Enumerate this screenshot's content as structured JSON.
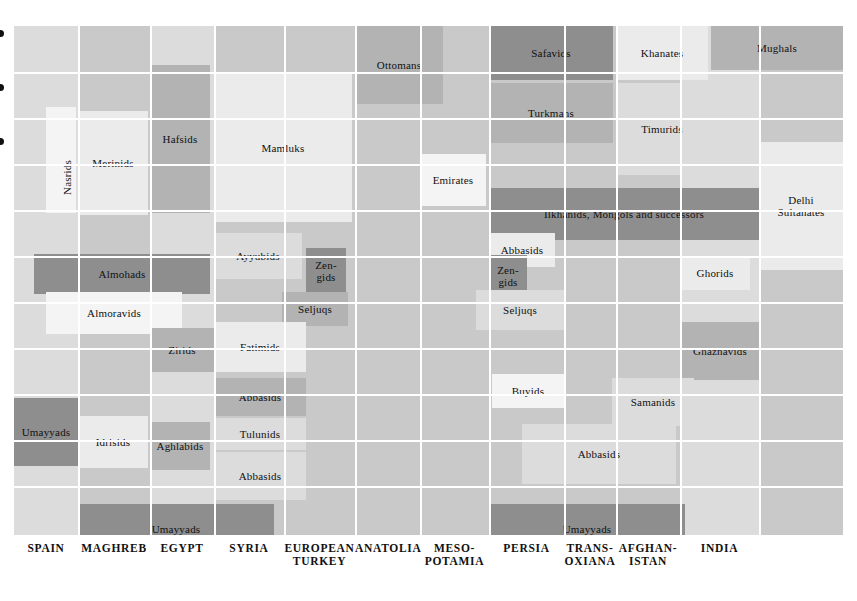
{
  "chart_data": {
    "type": "table",
    "xlabel": "Region",
    "ylabel": "Time",
    "grid": true,
    "legend": "none",
    "colors": {
      "dark": "#8e8e8e",
      "mid": "#b3b3b3",
      "base": "#c9c9c9",
      "light": "#dcdcdc",
      "pale": "#ebebeb",
      "white": "#f4f4f4",
      "gridline": "#ffffff",
      "text": "#111111"
    },
    "columns": [
      {
        "key": "spain",
        "label": "SPAIN"
      },
      {
        "key": "maghreb",
        "label": "MAGHREB"
      },
      {
        "key": "egypt",
        "label": "EGYPT"
      },
      {
        "key": "syria",
        "label": "SYRIA"
      },
      {
        "key": "euroturkey",
        "label": "EUROPEAN\nTURKEY"
      },
      {
        "key": "anatolia",
        "label": "ANATOLIA"
      },
      {
        "key": "mesopotamia",
        "label": "MESO-\nPOTAMIA"
      },
      {
        "key": "persia",
        "label": "PERSIA"
      },
      {
        "key": "transoxiana",
        "label": "TRANS-\nOXIANA"
      },
      {
        "key": "afghanistan",
        "label": "AFGHAN-\nISTAN"
      },
      {
        "key": "india",
        "label": "INDIA"
      }
    ],
    "entries": [
      {
        "name": "Ottomans",
        "label": "Ottomans",
        "x": 341,
        "y": 0,
        "w": 88,
        "h": 78,
        "tone": "mid"
      },
      {
        "name": "Safavids",
        "label": "Safavids",
        "x": 475,
        "y": 0,
        "w": 124,
        "h": 54,
        "tone": "dark"
      },
      {
        "name": "Khanates",
        "label": "Khanates",
        "x": 602,
        "y": 0,
        "w": 92,
        "h": 54,
        "tone": "pale"
      },
      {
        "name": "Mughals",
        "label": "Mughals",
        "x": 697,
        "y": 0,
        "w": 132,
        "h": 44,
        "tone": "mid"
      },
      {
        "name": "Turkmans",
        "label": "Turkmans",
        "x": 475,
        "y": 57,
        "w": 124,
        "h": 60,
        "tone": "mid"
      },
      {
        "name": "Timurids",
        "label": "Timurids",
        "x": 602,
        "y": 57,
        "w": 92,
        "h": 92,
        "tone": "light"
      },
      {
        "name": "Hafsids",
        "label": "Hafsids",
        "x": 136,
        "y": 39,
        "w": 60,
        "h": 148,
        "tone": "mid"
      },
      {
        "name": "Nasrids",
        "label": "Nasrids",
        "x": 32,
        "y": 81,
        "w": 30,
        "h": 106,
        "tone": "white",
        "vertical": true
      },
      {
        "name": "Merinids",
        "label": "Merinids",
        "x": 64,
        "y": 85,
        "w": 70,
        "h": 104,
        "tone": "pale"
      },
      {
        "name": "Mamluks",
        "label": "Mamluks",
        "x": 200,
        "y": 48,
        "w": 138,
        "h": 148,
        "tone": "pale"
      },
      {
        "name": "Emirates",
        "label": "Emirates",
        "x": 406,
        "y": 128,
        "w": 66,
        "h": 52,
        "tone": "white"
      },
      {
        "name": "DelhiSult",
        "label": "Delhi\nSultanates",
        "x": 745,
        "y": 116,
        "w": 84,
        "h": 128,
        "tone": "pale"
      },
      {
        "name": "Ilkhanids",
        "label": "Ilkhanids, Mongols and successors",
        "x": 475,
        "y": 162,
        "w": 270,
        "h": 52,
        "tone": "dark"
      },
      {
        "name": "AbbasidsMeso1",
        "label": "Abbasids",
        "x": 475,
        "y": 207,
        "w": 66,
        "h": 34,
        "tone": "pale"
      },
      {
        "name": "Ayyubids",
        "label": "Ayyubids",
        "x": 200,
        "y": 207,
        "w": 88,
        "h": 46,
        "tone": "light"
      },
      {
        "name": "ZengidsSyria",
        "label": "Zen-\ngids",
        "x": 292,
        "y": 222,
        "w": 40,
        "h": 46,
        "tone": "dark"
      },
      {
        "name": "ZengidsMeso",
        "label": "Zen-\ngids",
        "x": 475,
        "y": 229,
        "w": 38,
        "h": 42,
        "tone": "dark"
      },
      {
        "name": "Almohads",
        "label": "Almohads",
        "x": 20,
        "y": 228,
        "w": 176,
        "h": 40,
        "tone": "dark"
      },
      {
        "name": "Ghorids",
        "label": "Ghorids",
        "x": 666,
        "y": 230,
        "w": 70,
        "h": 34,
        "tone": "pale"
      },
      {
        "name": "Almoravids",
        "label": "Almoravids",
        "x": 32,
        "y": 266,
        "w": 136,
        "h": 42,
        "tone": "white"
      },
      {
        "name": "SeljuqsSyria",
        "label": "Seljuqs",
        "x": 268,
        "y": 266,
        "w": 66,
        "h": 34,
        "tone": "mid"
      },
      {
        "name": "SeljuqsMeso",
        "label": "Seljuqs",
        "x": 462,
        "y": 264,
        "w": 88,
        "h": 40,
        "tone": "light"
      },
      {
        "name": "Zirids",
        "label": "Zirids",
        "x": 136,
        "y": 302,
        "w": 64,
        "h": 44,
        "tone": "mid"
      },
      {
        "name": "Fatimids",
        "label": "Fatimids",
        "x": 200,
        "y": 296,
        "w": 92,
        "h": 50,
        "tone": "pale"
      },
      {
        "name": "Ghaznavids",
        "label": "Ghaznavids",
        "x": 666,
        "y": 296,
        "w": 80,
        "h": 58,
        "tone": "mid"
      },
      {
        "name": "Buyids",
        "label": "Buyids",
        "x": 478,
        "y": 348,
        "w": 72,
        "h": 34,
        "tone": "white"
      },
      {
        "name": "Samanids",
        "label": "Samanids",
        "x": 598,
        "y": 352,
        "w": 82,
        "h": 48,
        "tone": "light"
      },
      {
        "name": "AbbasidsEgy1",
        "label": "Abbasids",
        "x": 200,
        "y": 352,
        "w": 92,
        "h": 38,
        "tone": "mid"
      },
      {
        "name": "UmayyadsSpain",
        "label": "Umayyads",
        "x": 0,
        "y": 372,
        "w": 64,
        "h": 68,
        "tone": "dark"
      },
      {
        "name": "Idrisids",
        "label": "Idrisids",
        "x": 64,
        "y": 390,
        "w": 70,
        "h": 52,
        "tone": "pale"
      },
      {
        "name": "Aghlabids",
        "label": "Aghlabids",
        "x": 136,
        "y": 396,
        "w": 60,
        "h": 48,
        "tone": "mid"
      },
      {
        "name": "Tulunids",
        "label": "Tulunids",
        "x": 200,
        "y": 392,
        "w": 92,
        "h": 32,
        "tone": "light"
      },
      {
        "name": "AbbasidsPersia",
        "label": "Abbasids",
        "x": 508,
        "y": 398,
        "w": 154,
        "h": 60,
        "tone": "light"
      },
      {
        "name": "AbbasidsEgy2",
        "label": "Abbasids",
        "x": 200,
        "y": 426,
        "w": 92,
        "h": 48,
        "tone": "light"
      },
      {
        "name": "UmayyadsMagh",
        "label": "Umayyads",
        "x": 64,
        "y": 478,
        "w": 196,
        "h": 50,
        "tone": "dark"
      },
      {
        "name": "UmayyadsEast",
        "label": "Umayyads",
        "x": 475,
        "y": 478,
        "w": 196,
        "h": 50,
        "tone": "dark"
      }
    ],
    "vgrid": [
      64,
      136,
      200,
      270,
      341,
      406,
      475,
      550,
      602,
      666,
      745
    ],
    "hgrid": [
      46,
      92,
      138,
      184,
      230,
      276,
      322,
      368,
      414,
      460
    ],
    "ticks": [
      {
        "y": 4
      },
      {
        "y": 58
      },
      {
        "y": 112
      }
    ]
  }
}
